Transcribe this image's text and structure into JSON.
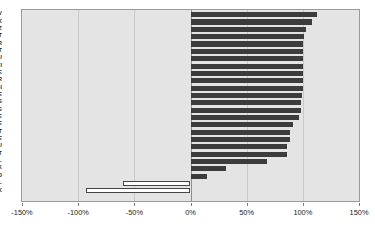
{
  "chart_data": {
    "type": "bar",
    "orientation": "horizontal",
    "title": "",
    "subtitle": "",
    "xlabel": "",
    "ylabel": "",
    "xlim": [
      -150,
      150
    ],
    "xticks": [
      -150,
      -100,
      -50,
      0,
      50,
      100,
      150
    ],
    "xtick_labels": [
      "-150%",
      "-100%",
      "-50%",
      "0%",
      "50%",
      "100%",
      "150%"
    ],
    "grid": true,
    "legend": false,
    "unit": "%",
    "categories": [
      "LV",
      "SK",
      "CZ",
      "PT",
      "FR",
      "LT",
      "LU",
      "FI",
      "EE",
      "GR",
      "SI",
      "BE",
      "ES",
      "BG",
      "SE",
      "IE",
      "IT",
      "DE",
      "HU",
      "AT",
      "PL",
      "UK",
      "RO",
      "NL",
      "DK"
    ],
    "values": [
      113,
      108,
      103,
      101,
      100,
      100,
      100,
      100,
      100,
      100,
      100,
      99,
      98,
      98,
      97,
      91,
      89,
      89,
      86,
      86,
      68,
      32,
      15,
      -60,
      -93
    ],
    "series": [
      {
        "name": "Change",
        "values": [
          113,
          108,
          103,
          101,
          100,
          100,
          100,
          100,
          100,
          100,
          100,
          99,
          98,
          98,
          97,
          91,
          89,
          89,
          86,
          86,
          68,
          32,
          15,
          -60,
          -93
        ]
      }
    ],
    "colors": {
      "positive_bar": "#3c3c3c",
      "negative_bar": "#ffffff",
      "negative_bar_border": "#454545",
      "plot_background": "#e4e4e4",
      "gridline": "#c9c9c9",
      "axis": "#7d7d7d",
      "text": "#1d1d1d"
    },
    "points": [
      {
        "category": "LV",
        "value": 113,
        "label": "113%"
      },
      {
        "category": "SK",
        "value": 108,
        "label": "108%"
      },
      {
        "category": "CZ",
        "value": 103,
        "label": "103%"
      },
      {
        "category": "PT",
        "value": 101,
        "label": "101%"
      },
      {
        "category": "FR",
        "value": 100,
        "label": "100%"
      },
      {
        "category": "LT",
        "value": 100,
        "label": "100%"
      },
      {
        "category": "LU",
        "value": 100,
        "label": "100%"
      },
      {
        "category": "FI",
        "value": 100,
        "label": "100%"
      },
      {
        "category": "EE",
        "value": 100,
        "label": "100%"
      },
      {
        "category": "GR",
        "value": 100,
        "label": "100%"
      },
      {
        "category": "SI",
        "value": 100,
        "label": "100%"
      },
      {
        "category": "BE",
        "value": 99,
        "label": "99%"
      },
      {
        "category": "ES",
        "value": 98,
        "label": "98%"
      },
      {
        "category": "BG",
        "value": 98,
        "label": "98%"
      },
      {
        "category": "SE",
        "value": 97,
        "label": "97%"
      },
      {
        "category": "IE",
        "value": 91,
        "label": "91%"
      },
      {
        "category": "IT",
        "value": 89,
        "label": "89%"
      },
      {
        "category": "DE",
        "value": 89,
        "label": "89%"
      },
      {
        "category": "HU",
        "value": 86,
        "label": "86%"
      },
      {
        "category": "AT",
        "value": 86,
        "label": "86%"
      },
      {
        "category": "PL",
        "value": 68,
        "label": "68%"
      },
      {
        "category": "UK",
        "value": 32,
        "label": "32%"
      },
      {
        "category": "RO",
        "value": 15,
        "label": "15%"
      },
      {
        "category": "NL",
        "value": -60,
        "label": "-60%"
      },
      {
        "category": "DK",
        "value": -93,
        "label": "-93%"
      }
    ]
  }
}
